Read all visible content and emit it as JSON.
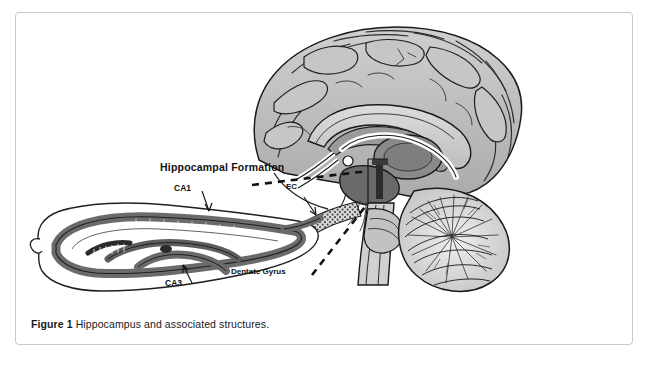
{
  "figure": {
    "caption_label": "Figure 1",
    "caption_text": "Hippocampus and associated structures.",
    "border_color": "#c9c9c9",
    "background": "#ffffff"
  },
  "diagram": {
    "labels": {
      "hippocampal_formation": "Hippocampal Formation",
      "ca1": "CA1",
      "ca3": "CA3",
      "ec": "EC",
      "dentate_gyrus": "Dentate Gyrus"
    },
    "palette": {
      "outline": "#1a1a1a",
      "cortex_fill": "#b9b9b9",
      "cortex_light": "#d2d2d2",
      "deep_gray": "#8d8d8d",
      "dark_gray": "#5a5a5a",
      "band_gray": "#6e6e6e",
      "white": "#ffffff"
    }
  }
}
